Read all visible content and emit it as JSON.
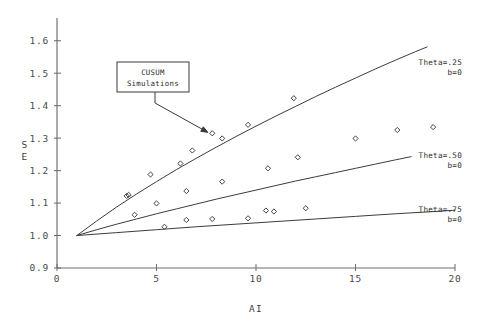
{
  "chart_data": {
    "type": "scatter",
    "title": "",
    "xlabel": "AI",
    "ylabel": "SE",
    "ylabel_lines": [
      "S",
      "E"
    ],
    "xlim": [
      0,
      20
    ],
    "ylim": [
      0.9,
      1.67
    ],
    "xticks": [
      0,
      5,
      10,
      15,
      20
    ],
    "xtick_labels": [
      "0",
      "5",
      "10",
      "15",
      "20"
    ],
    "yticks": [
      0.9,
      1.0,
      1.1,
      1.2,
      1.3,
      1.4,
      1.5,
      1.6
    ],
    "ytick_labels": [
      "0.9",
      "1.0",
      "1.1",
      "1.2",
      "1.3",
      "1.4",
      "1.5",
      "1.6"
    ],
    "grid": false,
    "legend_position": "inline-right-of-curves",
    "annotations": [
      {
        "name": "cusum-callout",
        "lines": [
          "CUSUM",
          "Simulations"
        ],
        "points_to": [
          7.8,
          1.315
        ]
      }
    ],
    "series": [
      {
        "name": "Theta=.25 b=0",
        "label_lines": [
          "Theta=.25",
          "b=0"
        ],
        "type": "line",
        "x": [
          1.0,
          2.0,
          3.0,
          4.0,
          5.0,
          6.0,
          7.0,
          8.0,
          9.0,
          10.0,
          11.0,
          12.0,
          13.0,
          14.0,
          15.0,
          16.0,
          17.0,
          18.0,
          18.6
        ],
        "y": [
          1.0,
          1.045,
          1.088,
          1.128,
          1.166,
          1.203,
          1.238,
          1.272,
          1.305,
          1.337,
          1.368,
          1.398,
          1.428,
          1.457,
          1.485,
          1.513,
          1.54,
          1.566,
          1.581
        ]
      },
      {
        "name": "Theta=.50 b=0",
        "label_lines": [
          "Theta=.50",
          "b=0"
        ],
        "type": "line",
        "x": [
          1.0,
          2.0,
          3.0,
          4.0,
          5.0,
          6.0,
          7.0,
          8.0,
          9.0,
          10.0,
          11.0,
          12.0,
          13.0,
          14.0,
          15.0,
          16.0,
          17.0,
          17.8
        ],
        "y": [
          1.0,
          1.018,
          1.035,
          1.051,
          1.067,
          1.082,
          1.097,
          1.112,
          1.126,
          1.14,
          1.154,
          1.168,
          1.181,
          1.194,
          1.207,
          1.22,
          1.233,
          1.243
        ]
      },
      {
        "name": "Theta=.75 b=0",
        "label_lines": [
          "Theta=.75",
          "b=0"
        ],
        "type": "line",
        "x": [
          1.0,
          3.0,
          5.0,
          7.0,
          9.0,
          11.0,
          13.0,
          15.0,
          17.0,
          19.0,
          20.0
        ],
        "y": [
          1.0,
          1.009,
          1.018,
          1.027,
          1.035,
          1.043,
          1.051,
          1.059,
          1.067,
          1.074,
          1.078
        ]
      },
      {
        "name": "CUSUM Simulations (Theta=.25)",
        "type": "scatter",
        "marker": "diamond",
        "x": [
          3.5,
          3.6,
          3.9,
          4.7,
          6.2,
          6.8,
          7.8,
          8.3,
          9.6,
          11.9
        ],
        "y": [
          1.122,
          1.125,
          1.064,
          1.188,
          1.222,
          1.262,
          1.315,
          1.299,
          1.341,
          1.423
        ]
      },
      {
        "name": "CUSUM Simulations (Theta=.50)",
        "type": "scatter",
        "marker": "diamond",
        "x": [
          5.0,
          6.5,
          8.3,
          10.6,
          12.1,
          15.0,
          17.1,
          18.9
        ],
        "y": [
          1.099,
          1.137,
          1.166,
          1.207,
          1.241,
          1.299,
          1.325,
          1.334
        ]
      },
      {
        "name": "CUSUM Simulations (Theta=.75)",
        "type": "scatter",
        "marker": "diamond",
        "x": [
          5.4,
          6.5,
          7.8,
          9.6,
          10.5,
          10.9,
          12.5
        ],
        "y": [
          1.027,
          1.048,
          1.051,
          1.053,
          1.077,
          1.074,
          1.084
        ]
      }
    ]
  },
  "colors": {
    "background": "#ffffff",
    "axis": "#6e6e6e",
    "curve": "#3c3c3c",
    "marker": "#3a3a3a",
    "text": "#3a3a3a"
  }
}
